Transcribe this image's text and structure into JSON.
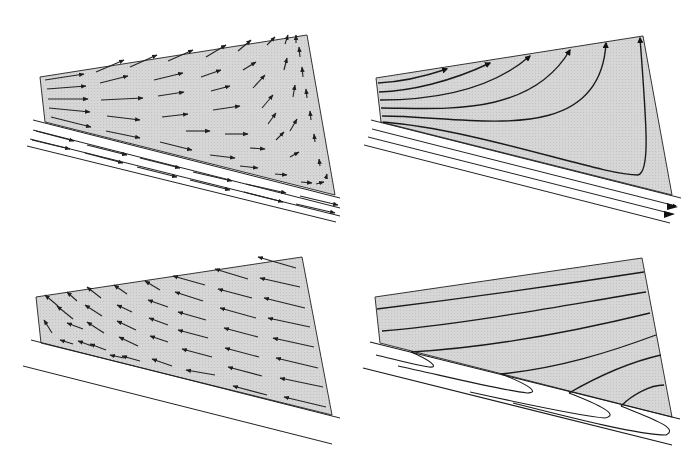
{
  "figure": {
    "panels": [
      {
        "id": "a",
        "label": "a",
        "description": "velocity vectors in wedge over basal conveyor"
      },
      {
        "id": "b",
        "label": "b",
        "description": "velocity vectors relative to wedge (backward)"
      },
      {
        "id": "c",
        "label": "c",
        "description": "particle trajectories / streamlines"
      },
      {
        "id": "d",
        "label": "d",
        "description": "deformed layering with recumbent folds at base"
      }
    ],
    "colors": {
      "wedge_fill": "#d4d4d4",
      "line": "#1e1e1e",
      "background": "#ffffff"
    }
  }
}
